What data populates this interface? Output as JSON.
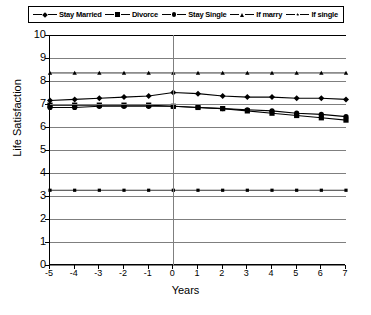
{
  "chart_data": {
    "type": "line",
    "title": "",
    "xlabel": "Years",
    "ylabel": "Life Satisfaction",
    "xlim": [
      -5,
      7
    ],
    "ylim": [
      0,
      10
    ],
    "ytick_labels": [
      "10",
      "9",
      "8",
      "7",
      "6",
      "5",
      "4",
      "3",
      "2",
      "1",
      "0"
    ],
    "xtick_labels": [
      "-5",
      "-4",
      "-3",
      "-2",
      "-1",
      "0",
      "1",
      "2",
      "3",
      "4",
      "5",
      "6",
      "7"
    ],
    "x": [
      -5,
      -4,
      -3,
      -2,
      -1,
      0,
      1,
      2,
      3,
      4,
      5,
      6,
      7
    ],
    "grid": "horizontal",
    "legend_position": "top",
    "reference_line_x": 0,
    "series": [
      {
        "name": "Stay Married",
        "marker": "diamond",
        "values": [
          7.15,
          7.2,
          7.25,
          7.3,
          7.35,
          7.5,
          7.45,
          7.35,
          7.3,
          7.3,
          7.25,
          7.25,
          7.2
        ]
      },
      {
        "name": "Divorce",
        "marker": "square",
        "values": [
          6.95,
          6.95,
          6.95,
          6.95,
          6.95,
          6.9,
          6.85,
          6.8,
          6.7,
          6.6,
          6.5,
          6.4,
          6.3
        ]
      },
      {
        "name": "Stay Single",
        "marker": "circle",
        "values": [
          6.85,
          6.85,
          6.9,
          6.9,
          6.9,
          6.9,
          6.85,
          6.8,
          6.75,
          6.7,
          6.6,
          6.55,
          6.45
        ]
      },
      {
        "name": "If marry",
        "marker": "triangle",
        "values": [
          8.35,
          8.35,
          8.35,
          8.35,
          8.35,
          8.35,
          8.35,
          8.35,
          8.35,
          8.35,
          8.35,
          8.35,
          8.35
        ]
      },
      {
        "name": "If single",
        "marker": "star",
        "values": [
          3.25,
          3.25,
          3.25,
          3.25,
          3.25,
          3.25,
          3.25,
          3.25,
          3.25,
          3.25,
          3.25,
          3.25,
          3.25
        ]
      }
    ]
  },
  "legend": {
    "items": [
      {
        "label": "Stay Married",
        "marker": "diamond"
      },
      {
        "label": "Divorce",
        "marker": "square"
      },
      {
        "label": "Stay Single",
        "marker": "circle"
      },
      {
        "label": "If marry",
        "marker": "triangle"
      },
      {
        "label": "If single",
        "marker": "star"
      }
    ]
  },
  "axes": {
    "y_title": "Life Satisfaction",
    "x_title": "Years"
  },
  "caption": "",
  "colors": {
    "series": "#000000",
    "grid": "#7f7f7f",
    "axis": "#000000",
    "background": "#ffffff"
  }
}
